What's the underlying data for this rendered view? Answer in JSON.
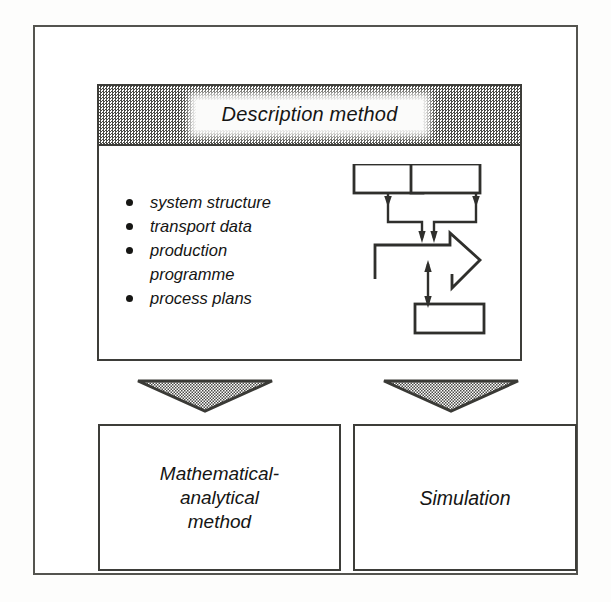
{
  "figure": {
    "title": "Description method",
    "description_panel": {
      "header_label": "Description method",
      "bullets": [
        {
          "text": "system structure",
          "bullet": true
        },
        {
          "text": "transport data",
          "bullet": true
        },
        {
          "text": "production",
          "bullet": true
        },
        {
          "text": "programme",
          "bullet": false
        },
        {
          "text": "process plans",
          "bullet": true
        }
      ],
      "schematic": {
        "name": "system-schematic",
        "box_top_left": "",
        "box_top_right": "",
        "box_bottom": "",
        "block_arrow_direction": "right",
        "arrows": [
          "top-left-box-down-into-block-arrow",
          "top-right-box-down-into-block-arrow",
          "bottom-box-bidirectional-to-block-arrow"
        ]
      }
    },
    "connectors": [
      {
        "name": "arrow-to-mathematical",
        "shape": "down-triangle",
        "fill": "stipple"
      },
      {
        "name": "arrow-to-simulation",
        "shape": "down-triangle",
        "fill": "stipple"
      }
    ],
    "methods": [
      {
        "name": "mathematical-analytical-method",
        "label": "Mathematical-\nanalytical\nmethod"
      },
      {
        "name": "simulation",
        "label": "Simulation"
      }
    ],
    "colors": {
      "ink": "#151514",
      "rule": "#3d3d39",
      "frame": "#54544f",
      "stipple_dark": "#4a4a46",
      "paper": "#ffffff"
    }
  }
}
